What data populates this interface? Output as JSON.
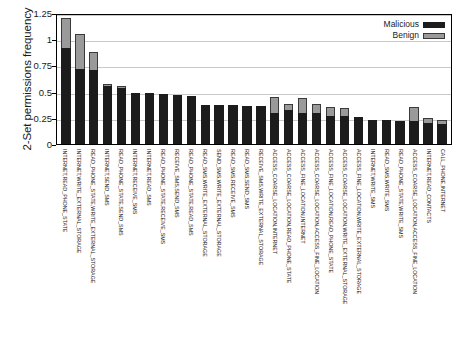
{
  "chart_data": {
    "type": "bar",
    "subtype": "stacked-vertical",
    "title": "",
    "xlabel": "",
    "ylabel": "2-Set permissions frequency",
    "ylim": [
      0,
      1.25
    ],
    "yticks": [
      "0",
      "0.25",
      "0.5",
      "0.75",
      "1",
      "1.25"
    ],
    "ytick_values": [
      0,
      0.25,
      0.5,
      0.75,
      1,
      1.25
    ],
    "grid": true,
    "grid_axis": "y",
    "legend_position": "top-right",
    "legend": [
      "Malicious",
      "Benign"
    ],
    "colors": {
      "malicious": "#1c1c1c",
      "benign": "#9a9a9a",
      "grid": "#c9c9c9",
      "frame": "#000000"
    },
    "categories": [
      "INTERNET,READ_PHONE_STATE",
      "INTERNET,WRITE_EXTERNAL_STORAGE",
      "READ_PHONE_STATE,WRITE_EXTERNAL_STORAGE",
      "INTERNET,SEND_SMS",
      "READ_PHONE_STATE,SEND_SMS",
      "INTERNET,RECEIVE_SMS",
      "INTERNET,READ_SMS",
      "READ_PHONE_STATE,RECEIVE_SMS",
      "RECEIVE_SMS,SEND_SMS",
      "READ_PHONE_STATE,READ_SMS",
      "READ_SMS,WRITE_EXTERNAL_STORAGE",
      "SEND_SMS,WRITE_EXTERNAL_STORAGE",
      "READ_SMS,RECEIVE_SMS",
      "READ_SMS,SEND_SMS",
      "RECEIVE_SMS,WRITE_EXTERNAL_STORAGE",
      "ACCESS_COARSE_LOCATION,INTERNET",
      "ACCESS_COARSE_LOCATION,READ_PHONE_STATE",
      "ACCESS_FINE_LOCATION,INTERNET",
      "ACCESS_COARSE_LOCATION,ACCESS_FINE_LOCATION",
      "ACCESS_FINE_LOCATION,READ_PHONE_STATE",
      "ACCESS_COARSE_LOCATION,WRITE_EXTERNAL_STORAGE",
      "ACCESS_FINE_LOCATION,WRITE_EXTERNAL_STORAGE",
      "INTERNET,WRITE_SMS",
      "READ_SMS,WRITE_SMS",
      "READ_PHONE_STATE,WRITE_SMS",
      "ACCESS_COARSE_LOCATION,ACCESS_FINE_LOCATION",
      "INTERNET,READ_CONTACTS",
      "CALL_PHONE,INTERNET"
    ],
    "series": [
      {
        "name": "Malicious",
        "color": "#1c1c1c",
        "values": [
          0.92,
          0.72,
          0.71,
          0.55,
          0.53,
          0.49,
          0.49,
          0.48,
          0.47,
          0.46,
          0.37,
          0.37,
          0.37,
          0.36,
          0.36,
          0.3,
          0.32,
          0.3,
          0.3,
          0.27,
          0.27,
          0.26,
          0.23,
          0.23,
          0.22,
          0.22,
          0.2,
          0.19
        ]
      },
      {
        "name": "Benign",
        "color": "#9a9a9a",
        "values": [
          0.28,
          0.33,
          0.17,
          0.02,
          0.02,
          0.0,
          0.0,
          0.0,
          0.0,
          0.0,
          0.0,
          0.0,
          0.0,
          0.0,
          0.0,
          0.15,
          0.06,
          0.14,
          0.08,
          0.08,
          0.07,
          0.0,
          0.0,
          0.0,
          0.0,
          0.13,
          0.05,
          0.04
        ]
      }
    ],
    "totals": [
      1.2,
      1.05,
      0.88,
      0.57,
      0.55,
      0.49,
      0.49,
      0.48,
      0.47,
      0.46,
      0.37,
      0.37,
      0.37,
      0.36,
      0.36,
      0.45,
      0.38,
      0.44,
      0.38,
      0.35,
      0.34,
      0.26,
      0.23,
      0.23,
      0.22,
      0.35,
      0.25,
      0.23
    ]
  }
}
